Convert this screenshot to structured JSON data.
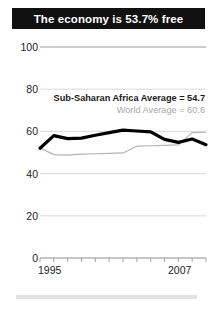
{
  "header": {
    "title": "The economy is 53.7% free"
  },
  "legend": {
    "africa": "Sub-Saharan Africa Average = 54.7",
    "world": "World Average = 60.6"
  },
  "colors": {
    "title_bar": "#111111",
    "title_text": "#ffffff",
    "africa_line": "#000000",
    "world_line": "#b4b4b4",
    "gridline": "#cfcfcf",
    "axis_text": "#1c1c1c"
  },
  "chart_data": {
    "type": "line",
    "title": "The economy is 53.7% free",
    "xlabel": "",
    "ylabel": "",
    "xlim": [
      1995,
      2007
    ],
    "ylim": [
      0,
      100
    ],
    "yticks": [
      0,
      20,
      40,
      60,
      80,
      100
    ],
    "ytick_labels": [
      "0",
      "20",
      "40",
      "60",
      "80",
      "100"
    ],
    "xticks": [
      1995,
      1996,
      1997,
      1998,
      1999,
      2000,
      2001,
      2002,
      2003,
      2004,
      2005,
      2006,
      2007
    ],
    "xtick_labels_shown": [
      "1995",
      "2007"
    ],
    "grid": true,
    "legend_position": "upper-right",
    "x": [
      1995,
      1996,
      1997,
      1998,
      1999,
      2000,
      2001,
      2002,
      2003,
      2004,
      2005,
      2006,
      2007
    ],
    "series": [
      {
        "name": "Sub-Saharan Africa Average",
        "label": "Sub-Saharan Africa Average = 54.7",
        "value": 54.7,
        "color": "#000000",
        "width": 3.2,
        "values": [
          52.0,
          58.0,
          56.6,
          56.8,
          58.2,
          59.4,
          60.6,
          60.2,
          59.8,
          56.2,
          54.8,
          56.4,
          53.7
        ]
      },
      {
        "name": "World Average",
        "label": "World Average = 60.6",
        "value": 60.6,
        "color": "#b4b4b4",
        "width": 1.2,
        "values": [
          52.2,
          49.0,
          48.8,
          49.2,
          49.4,
          49.6,
          49.8,
          53.0,
          53.2,
          53.4,
          53.6,
          59.4,
          59.6
        ]
      }
    ]
  },
  "axis": {
    "x_start_label": "1995",
    "x_end_label": "2007"
  }
}
